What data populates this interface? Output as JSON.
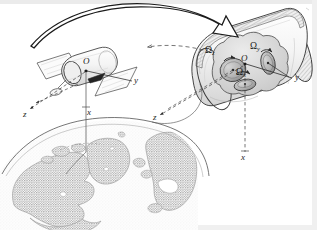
{
  "figure": {
    "kind": "technical-line-diagram",
    "background_color": "#ffffff",
    "ink_color": "#1d1d1d"
  },
  "satellite_view": {
    "origin_label": "O",
    "axis_y_label": "y",
    "axis_x_label": "x",
    "axis_z_label": "z"
  },
  "cutaway_view": {
    "origin_label": "O",
    "axis_y_label": "y",
    "axis_x_label": "x",
    "axis_z_label": "z",
    "wheels": [
      {
        "id": "wheel-z",
        "label_omega": "Ω",
        "label_sub": "z"
      },
      {
        "id": "wheel-y",
        "label_omega": "Ω",
        "label_sub": "y"
      },
      {
        "id": "wheel-x",
        "label_omega": "Ω",
        "label_sub": "x"
      }
    ]
  },
  "earth": {
    "description": "stippled globe limb showing North America, Greenland and Europe"
  },
  "callout_arrow": {
    "description": "large hollow curved arrow from satellite to magnified cutaway"
  },
  "colors": {
    "ink": "#1d1d1d",
    "line_mid": "#4a4a4a",
    "line_light": "#8a8a8a",
    "fill_body": "#d9d9d9",
    "fill_wheel": "#b5b5b5",
    "fill_panel": "#f2f2f2",
    "earth_land": "#9a9a9a",
    "page_edge": "#e9e9e9"
  }
}
